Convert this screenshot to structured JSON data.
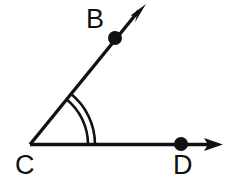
{
  "figure": {
    "kind": "geometry-angle-diagram",
    "background_color": "#ffffff",
    "stroke_color": "#111111",
    "stroke_width": 3,
    "width": 233,
    "height": 189,
    "labels": {
      "b": "B",
      "c": "C",
      "d": "D"
    },
    "points": {
      "vertex_c": {
        "name": "C",
        "x": 30,
        "y": 145
      },
      "point_b": {
        "name": "B",
        "x": 115,
        "y": 38,
        "dot": true,
        "dot_radius": 7
      },
      "point_d": {
        "name": "D",
        "x": 181,
        "y": 144,
        "dot": true,
        "dot_radius": 7
      }
    },
    "rays": [
      {
        "name": "ray-cb",
        "from": "C",
        "through": "B",
        "arrow_tip": {
          "x": 146,
          "y": 5
        },
        "arrowhead": true
      },
      {
        "name": "ray-cd",
        "from": "C",
        "through": "D",
        "arrow_tip": {
          "x": 223,
          "y": 144
        },
        "arrowhead": true
      }
    ],
    "angle_marks": {
      "name": "double-arc",
      "count": 2,
      "radii": [
        58,
        65
      ],
      "start_angle_deg": 0,
      "end_angle_deg": 51.5
    }
  }
}
